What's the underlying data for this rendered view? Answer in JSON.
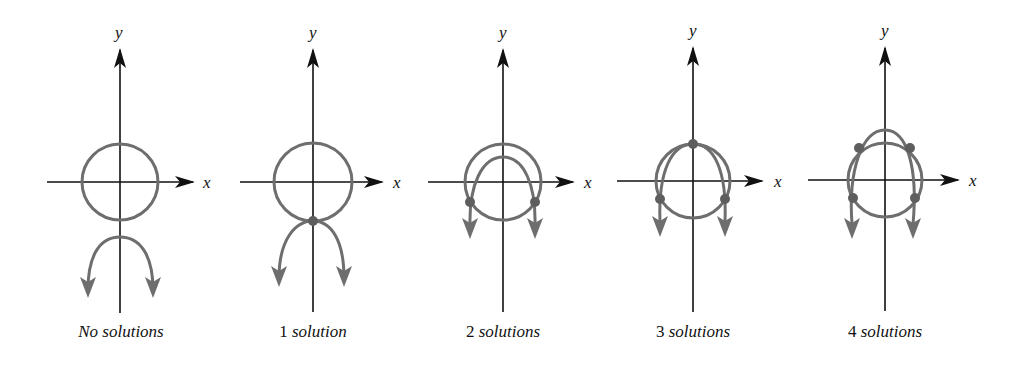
{
  "figure": {
    "colors": {
      "axis": "#111111",
      "curve": "#6e6e6e",
      "point": "#5e5e5e",
      "background": "#ffffff"
    },
    "panels": [
      {
        "id": "no-solutions",
        "caption": {
          "number": "",
          "word": "No solutions"
        },
        "axis_labels": {
          "x": "x",
          "y": "y"
        },
        "origin": [
          120,
          182
        ],
        "circle_radius": 38,
        "parabola": {
          "vertex_y": 237,
          "arms": [
            [
              88,
              295
            ],
            [
              153,
              295
            ]
          ],
          "direction": "down"
        },
        "intersection_points": []
      },
      {
        "id": "one-solution",
        "caption": {
          "number": "1",
          "word": "solution"
        },
        "axis_labels": {
          "x": "x",
          "y": "y"
        },
        "origin": [
          313,
          182
        ],
        "circle_radius": 39,
        "parabola": {
          "vertex_y": 221,
          "arms": [
            [
              279,
              283
            ],
            [
              344,
              283
            ]
          ],
          "direction": "down"
        },
        "intersection_points": [
          [
            313,
            221
          ]
        ]
      },
      {
        "id": "two-solutions",
        "caption": {
          "number": "2",
          "word": "solutions"
        },
        "axis_labels": {
          "x": "x",
          "y": "y"
        },
        "origin": [
          503,
          182
        ],
        "circle_radius": 38,
        "parabola": {
          "vertex_y": 157,
          "arms": [
            [
              470,
              237
            ],
            [
              535,
              237
            ]
          ],
          "direction": "down"
        },
        "intersection_points": [
          [
            470,
            202
          ],
          [
            535,
            202
          ]
        ]
      },
      {
        "id": "three-solutions",
        "caption": {
          "number": "3",
          "word": "solutions"
        },
        "axis_labels": {
          "x": "x",
          "y": "y"
        },
        "origin": [
          693,
          181
        ],
        "circle_radius": 37,
        "parabola": {
          "vertex_y": 144,
          "arms": [
            [
              660,
              235
            ],
            [
              725,
              235
            ]
          ],
          "direction": "down"
        },
        "intersection_points": [
          [
            693,
            144
          ],
          [
            660,
            199
          ],
          [
            725,
            199
          ]
        ]
      },
      {
        "id": "four-solutions",
        "caption": {
          "number": "4",
          "word": "solutions"
        },
        "axis_labels": {
          "x": "x",
          "y": "y"
        },
        "origin": [
          885,
          180
        ],
        "circle_radius": 37,
        "parabola": {
          "vertex_y": 130,
          "arms": [
            [
              852,
              237
            ],
            [
              913,
              237
            ]
          ],
          "direction": "down"
        },
        "intersection_points": [
          [
            859,
            148
          ],
          [
            910,
            148
          ],
          [
            853,
            198
          ],
          [
            915,
            198
          ]
        ]
      }
    ]
  }
}
